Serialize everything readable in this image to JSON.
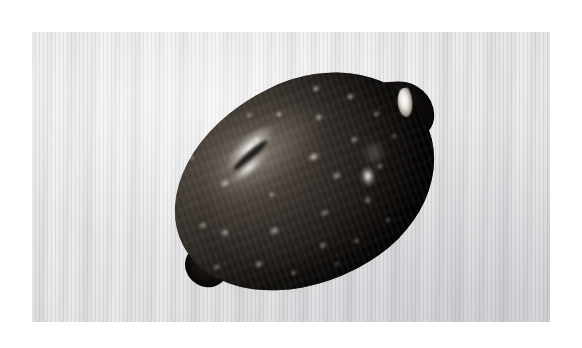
{
  "image": {
    "kind": "photograph",
    "subject": "cowrie-shell",
    "caption": "",
    "alt_text": "Dark brown and black cowrie shell with white speckles resting on a white ribbed cloth background",
    "width": 582,
    "height": 348
  },
  "plate": {
    "left": 32,
    "top": 32,
    "width": 518,
    "height": 290,
    "margin_color": "#ffffff"
  },
  "background": {
    "name": "white ribbed cloth",
    "base_color": "#ececed",
    "highlight_color": "#f6f6f7",
    "shadow_color": "#d9d9dc",
    "texture": "fine vertical weave stripes with moire banding"
  },
  "subject": {
    "name": "cowrie shell",
    "orientation": "tilted, anterior tip to upper right",
    "body_color": "#1a1613",
    "mid_tone_color": "#463e37",
    "highlight_color": "#ffffff",
    "spot_color": "#f3f0e9",
    "aperture_lip_color": "#ffffff",
    "bounds": {
      "left": 168,
      "top": 83,
      "right": 437,
      "bottom": 285
    },
    "features": [
      "large white specular streak on the upper left dorsum",
      "bright white glint on the lower right flank",
      "white aperture lip at the upper right tip",
      "protruding posterior nub at the lower left",
      "scattered pale cream speckles across the dorsum"
    ]
  },
  "shadow": {
    "name": "contact shadow",
    "color": "#46464e",
    "opacity": 0.38
  },
  "spots": [
    {
      "x": 22,
      "y": 30,
      "w": 11,
      "h": 9,
      "o": 0.75
    },
    {
      "x": 40,
      "y": 18,
      "w": 9,
      "h": 8,
      "o": 0.7
    },
    {
      "x": 55,
      "y": 38,
      "w": 13,
      "h": 10,
      "o": 0.8
    },
    {
      "x": 14,
      "y": 52,
      "w": 10,
      "h": 9,
      "o": 0.7
    },
    {
      "x": 30,
      "y": 62,
      "w": 12,
      "h": 10,
      "o": 0.65
    },
    {
      "x": 8,
      "y": 44,
      "w": 9,
      "h": 8,
      "o": 0.6
    },
    {
      "x": 20,
      "y": 74,
      "w": 10,
      "h": 8,
      "o": 0.6
    },
    {
      "x": 44,
      "y": 80,
      "w": 9,
      "h": 8,
      "o": 0.55
    },
    {
      "x": 36,
      "y": 46,
      "w": 8,
      "h": 7,
      "o": 0.6
    },
    {
      "x": 52,
      "y": 12,
      "w": 8,
      "h": 7,
      "o": 0.75
    },
    {
      "x": 64,
      "y": 22,
      "w": 10,
      "h": 8,
      "o": 0.7
    },
    {
      "x": 68,
      "y": 9,
      "w": 9,
      "h": 7,
      "o": 0.72
    },
    {
      "x": 78,
      "y": 20,
      "w": 9,
      "h": 8,
      "o": 0.65
    },
    {
      "x": 60,
      "y": 52,
      "w": 11,
      "h": 9,
      "o": 0.6
    },
    {
      "x": 72,
      "y": 40,
      "w": 9,
      "h": 8,
      "o": 0.6
    },
    {
      "x": 84,
      "y": 34,
      "w": 8,
      "h": 7,
      "o": 0.55
    },
    {
      "x": 50,
      "y": 66,
      "w": 10,
      "h": 8,
      "o": 0.5
    },
    {
      "x": 66,
      "y": 70,
      "w": 10,
      "h": 9,
      "o": 0.5
    },
    {
      "x": 76,
      "y": 58,
      "w": 8,
      "h": 7,
      "o": 0.5
    },
    {
      "x": 30,
      "y": 86,
      "w": 8,
      "h": 7,
      "o": 0.45
    },
    {
      "x": 56,
      "y": 86,
      "w": 9,
      "h": 7,
      "o": 0.42
    },
    {
      "x": 42,
      "y": 6,
      "w": 8,
      "h": 6,
      "o": 0.6
    },
    {
      "x": 88,
      "y": 12,
      "w": 7,
      "h": 6,
      "o": 0.5
    },
    {
      "x": 16,
      "y": 12,
      "w": 7,
      "h": 6,
      "o": 0.45
    },
    {
      "x": 6,
      "y": 66,
      "w": 8,
      "h": 7,
      "o": 0.5
    },
    {
      "x": 86,
      "y": 48,
      "w": 7,
      "h": 6,
      "o": 0.45
    },
    {
      "x": 70,
      "y": 84,
      "w": 8,
      "h": 6,
      "o": 0.38
    },
    {
      "x": 46,
      "y": 92,
      "w": 7,
      "h": 6,
      "o": 0.35
    }
  ]
}
